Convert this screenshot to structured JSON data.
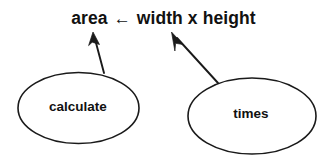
{
  "diagram": {
    "background_color": "#ffffff",
    "stroke_color": "#1a1a1a",
    "text_color": "#111111",
    "formula": {
      "lhs": "area",
      "operator": "←",
      "rhs": "width x height",
      "full_text": "area ← width x height"
    },
    "nodes": [
      {
        "id": "calculate",
        "label": "calculate",
        "shape": "ellipse",
        "cx": 78.5,
        "cy": 108,
        "rx": 60.5,
        "ry": 35.5
      },
      {
        "id": "times",
        "label": "times",
        "shape": "ellipse",
        "cx": 252,
        "cy": 116,
        "rx": 64,
        "ry": 38
      }
    ],
    "arrows": [
      {
        "id": "calculate-to-formula",
        "from_node": "calculate",
        "to_target": "formula",
        "start_x": 104,
        "start_y": 73,
        "end_x": 93,
        "end_y": 33,
        "head": "filled-triangle"
      },
      {
        "id": "times-to-formula",
        "from_node": "times",
        "to_target": "formula",
        "start_x": 218,
        "start_y": 83,
        "end_x": 172,
        "end_y": 33,
        "head": "filled-triangle"
      }
    ]
  }
}
